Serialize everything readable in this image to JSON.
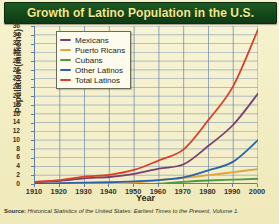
{
  "title": "Growth of Latino Population in the U.S.",
  "source_prefix": "Source:",
  "source_text": "Historical Statistics of the United States: Earliest Times to the Present, Volume 1.",
  "colors": {
    "title_bar": "#15491b",
    "title_text": "#f5e98a",
    "background": "#f2edc2",
    "grid": "#5f7fa8",
    "axis": "#5f7fa8",
    "mexicans": "#7b3f6e",
    "puerto_ricans": "#e0a53c",
    "cubans": "#4a9c3c",
    "other_latinos": "#2b62a8",
    "total_latinos": "#d8402a"
  },
  "legend": {
    "items": [
      {
        "label": "Mexicans",
        "color": "#7b3f6e"
      },
      {
        "label": "Puerto Ricans",
        "color": "#e0a53c"
      },
      {
        "label": "Cubans",
        "color": "#4a9c3c"
      },
      {
        "label": "Other Latinos",
        "color": "#2b62a8"
      },
      {
        "label": "Total Latinos",
        "color": "#d8402a"
      }
    ]
  },
  "chart_data": {
    "type": "line",
    "title": "Growth of Latino Population in the U.S.",
    "xlabel": "Year",
    "ylabel": "Population (millions)",
    "x": [
      1910,
      1920,
      1930,
      1940,
      1950,
      1960,
      1970,
      1980,
      1990,
      2000
    ],
    "xlim": [
      1910,
      2000
    ],
    "ylim": [
      0,
      36
    ],
    "ytick_step": 2,
    "yticks": [
      0,
      2,
      4,
      6,
      8,
      10,
      12,
      14,
      16,
      18,
      20,
      22,
      24,
      26,
      28,
      30,
      32,
      34,
      36
    ],
    "xticks": [
      1910,
      1920,
      1930,
      1940,
      1950,
      1960,
      1970,
      1980,
      1990,
      2000
    ],
    "grid": true,
    "legend_position": "upper-left-inside",
    "series": [
      {
        "name": "Mexicans",
        "color": "#7b3f6e",
        "values": [
          0.4,
          0.7,
          1.3,
          1.6,
          2.3,
          3.5,
          4.5,
          8.7,
          13.5,
          20.6
        ]
      },
      {
        "name": "Puerto Ricans",
        "color": "#e0a53c",
        "values": [
          0.0,
          0.0,
          0.1,
          0.1,
          0.3,
          0.9,
          1.4,
          2.0,
          2.7,
          3.4
        ]
      },
      {
        "name": "Cubans",
        "color": "#4a9c3c",
        "values": [
          0.0,
          0.0,
          0.0,
          0.0,
          0.0,
          0.1,
          0.5,
          0.8,
          1.0,
          1.2
        ]
      },
      {
        "name": "Other Latinos",
        "color": "#2b62a8",
        "values": [
          0.1,
          0.2,
          0.3,
          0.4,
          0.6,
          0.9,
          1.5,
          3.1,
          5.1,
          10.0
        ]
      },
      {
        "name": "Total Latinos",
        "color": "#d8402a",
        "values": [
          0.5,
          0.9,
          1.7,
          2.1,
          3.2,
          5.4,
          7.9,
          14.6,
          22.3,
          35.2
        ]
      }
    ]
  }
}
